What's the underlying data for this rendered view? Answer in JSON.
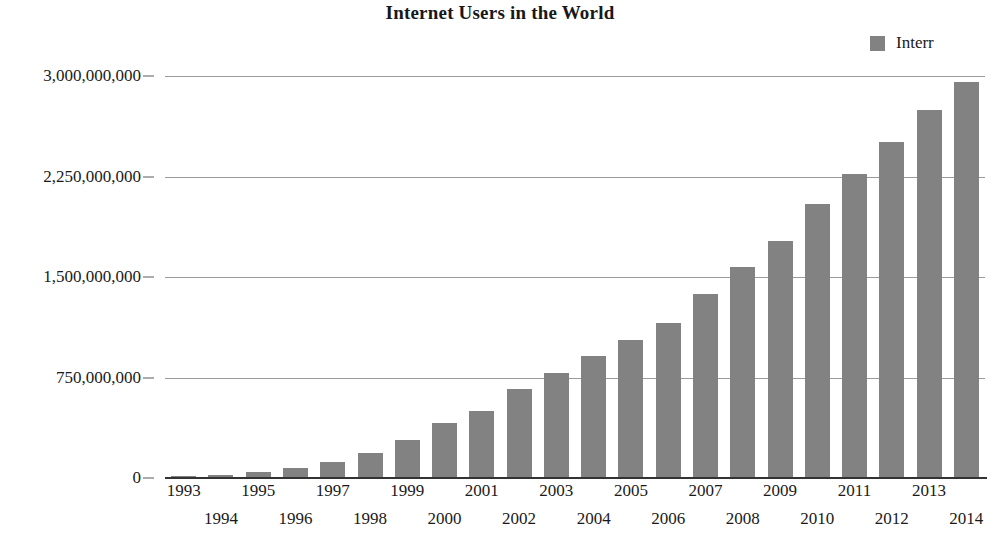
{
  "chart_data": {
    "type": "bar",
    "title": "Internet Users in the World",
    "xlabel": "",
    "ylabel": "",
    "ylim": [
      0,
      3000000000
    ],
    "yticks": [
      0,
      750000000,
      1500000000,
      2250000000,
      3000000000
    ],
    "ytick_labels": [
      "0",
      "750,000,000",
      "1,500,000,000",
      "2,250,000,000",
      "3,000,000,000"
    ],
    "grid": true,
    "legend_position": "top-right",
    "series": [
      {
        "name": "Interr",
        "color": "#828282",
        "values": [
          14000000,
          25000000,
          45000000,
          77000000,
          120000000,
          188000000,
          281000000,
          414000000,
          502000000,
          663000000,
          781000000,
          913000000,
          1029000000,
          1157000000,
          1373000000,
          1575000000,
          1766000000,
          2044000000,
          2270000000,
          2511000000,
          2749000000,
          2956000000
        ]
      }
    ],
    "categories": [
      "1993",
      "1994",
      "1995",
      "1996",
      "1997",
      "1998",
      "1999",
      "2000",
      "2001",
      "2002",
      "2003",
      "2004",
      "2005",
      "2006",
      "2007",
      "2008",
      "2009",
      "2010",
      "2011",
      "2012",
      "2013",
      "2014"
    ]
  },
  "legend": {
    "label": "Interr",
    "swatch_color": "#828282"
  }
}
